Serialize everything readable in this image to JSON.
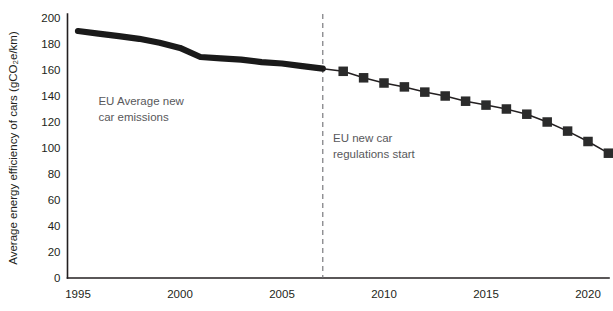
{
  "chart_data": {
    "type": "line",
    "title": "",
    "subtitle": "",
    "xlabel": "",
    "ylabel": "Average energy efficiency of cars (gCO₂e/km)",
    "xlim": [
      1994.2,
      2021.5
    ],
    "ylim": [
      0,
      200
    ],
    "grid": false,
    "legend_position": "none",
    "x_ticks": [
      1995,
      2000,
      2005,
      2010,
      2015,
      2020
    ],
    "x_tick_labels": [
      "1995",
      "2000",
      "2005",
      "2010",
      "2015",
      "2020"
    ],
    "y_ticks": [
      0,
      20,
      40,
      60,
      80,
      100,
      120,
      140,
      160,
      180,
      200
    ],
    "y_tick_labels": [
      "0",
      "20",
      "40",
      "60",
      "80",
      "100",
      "120",
      "140",
      "160",
      "180",
      "200"
    ],
    "series": [
      {
        "name": "EU Average new car emissions",
        "style": "thick-line",
        "markers": false,
        "x": [
          1995,
          1996,
          1997,
          1998,
          1999,
          2000,
          2001,
          2002,
          2003,
          2004,
          2005,
          2006,
          2007
        ],
        "values": [
          190,
          188,
          186,
          184,
          181,
          177,
          170,
          169,
          168,
          166,
          165,
          163,
          161
        ]
      },
      {
        "name": "EU new car emissions under regulation",
        "style": "line-with-square-markers",
        "markers": true,
        "x": [
          2008,
          2009,
          2010,
          2011,
          2012,
          2013,
          2014,
          2015,
          2016,
          2017,
          2018,
          2019,
          2020,
          2021
        ],
        "values": [
          159,
          154,
          150,
          147,
          143,
          140,
          136,
          133,
          130,
          126,
          120,
          113,
          105,
          96
        ]
      }
    ],
    "annotations": [
      {
        "name": "eu-average-label",
        "lines": [
          "EU Average new",
          "car emissions"
        ],
        "x": 1996.0,
        "y": 133
      },
      {
        "name": "eu-regulations-label",
        "lines": [
          "EU new car",
          "regulations start"
        ],
        "x": 2007.5,
        "y": 105
      }
    ],
    "event_marker": {
      "name": "eu-new-car-regulations-start",
      "x": 2007,
      "style": "vertical-dashed"
    },
    "colors": {
      "line": "#1a1a1a",
      "marker": "#2b2b2b",
      "axis": "#231f20",
      "annotation_text": "#58585b",
      "divider": "#6e6e72",
      "background": "#ffffff"
    }
  }
}
